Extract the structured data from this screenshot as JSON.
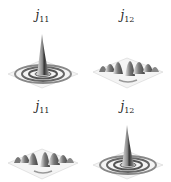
{
  "figure": {
    "panels": [
      {
        "position": "top-left",
        "label_main": "j",
        "label_sub": "11",
        "surface": "central-peak"
      },
      {
        "position": "top-right",
        "label_main": "j",
        "label_sub": "12",
        "surface": "multi-lobe"
      },
      {
        "position": "bottom-left",
        "label_main": "j",
        "label_sub": "11",
        "surface": "multi-lobe"
      },
      {
        "position": "bottom-right",
        "label_main": "j",
        "label_sub": "12",
        "surface": "central-peak"
      }
    ]
  }
}
